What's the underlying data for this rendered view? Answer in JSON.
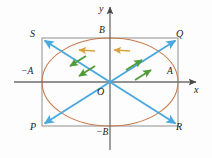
{
  "figure": {
    "colors": {
      "axis": "#6b6b6b",
      "rectangle": "#8a8a8a",
      "ellipse": "#c77b4e",
      "diagonal": "#4aa8e0",
      "arrow_orange": "#e0a030",
      "arrow_green": "#4f9b38",
      "label": "#1a1a1a",
      "background": "#fdfdfd"
    },
    "axes": {
      "x_label": "x",
      "y_label": "y",
      "origin_label": "O"
    },
    "ticks": {
      "x_negative": "−A",
      "x_positive": "A",
      "y_positive": "B",
      "y_negative": "−B"
    },
    "corners": {
      "top_left": "S",
      "top_right": "Q",
      "bottom_left": "P",
      "bottom_right": "R"
    },
    "geometry": {
      "origin_x": 110,
      "origin_y": 82,
      "semi_axis_a": 68,
      "semi_axis_b": 44,
      "rect_left": 42,
      "rect_right": 178,
      "rect_top": 38,
      "rect_bottom": 126
    },
    "flow_arrows": {
      "orange_count": 2,
      "orange_direction": "leftward",
      "green_count": 4,
      "green_direction_left_pair": "down-left",
      "green_direction_right_pair": "up-right"
    }
  }
}
